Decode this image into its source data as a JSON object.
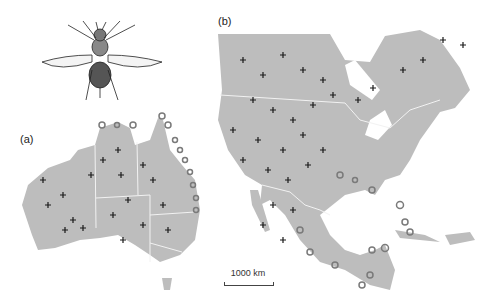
{
  "figure": {
    "panel_a_label": "(a)",
    "panel_b_label": "(b)",
    "scale_label": "1000 km",
    "land_color": "#bdbdbd",
    "marker_plus_color": "#1a1a1a",
    "marker_ring_color": "#7a7a7a",
    "illustration": "fly-insect-illustration"
  },
  "legend_markers": {
    "plus": "cross-marker",
    "ring": "ring-marker",
    "dot": "small-dot-marker"
  }
}
